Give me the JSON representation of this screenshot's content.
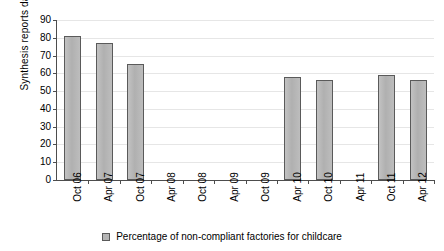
{
  "chart_data": {
    "type": "bar",
    "title": "",
    "xlabel": "",
    "ylabel": "Synthesis reports dates",
    "ylim": [
      0,
      90
    ],
    "ytick_step": 10,
    "yticks": [
      90,
      80,
      70,
      60,
      50,
      40,
      30,
      20,
      10,
      0
    ],
    "grid": true,
    "legend_position": "bottom",
    "categories": [
      "Oct 06",
      "Apr 07",
      "Oct 07",
      "Apr 08",
      "Oct 08",
      "Apr 09",
      "Oct 09",
      "Apr 10",
      "Oct 10",
      "Apr 11",
      "Oct 11",
      "Apr 12"
    ],
    "series": [
      {
        "name": "Percentage of non-compliant factories for childcare",
        "color": "#b5b5b5",
        "values": [
          81,
          77,
          65,
          null,
          null,
          null,
          null,
          58,
          56,
          null,
          59,
          56
        ]
      }
    ]
  },
  "legend": {
    "entries": [
      {
        "label": "Percentage of non-compliant factories for childcare",
        "swatch": "legend-swatch-icon"
      }
    ]
  }
}
